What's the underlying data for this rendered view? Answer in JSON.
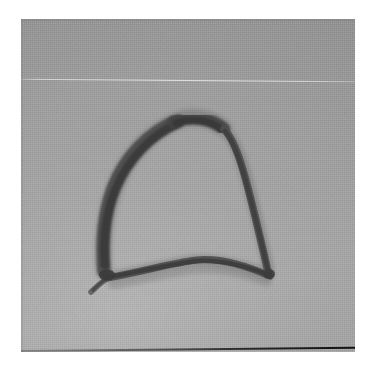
{
  "page": {
    "width": 378,
    "height": 375,
    "border_color": "#ffffff",
    "kind": "scanned-photograph"
  },
  "photo": {
    "x": 21,
    "y": 19,
    "width": 334,
    "height": 333,
    "background_color": "#9d9d9d",
    "background_highlight": "#a6a6a6",
    "background_shadow": "#939393",
    "caption": "",
    "artifacts": {
      "scratch_line": "faint light horizontal scratch across upper third",
      "bottom_edge": "dark film edge along bottom border"
    }
  },
  "artwork": {
    "title": "",
    "subject": "hand-drawn arch outline",
    "medium": "dark brush / ink stroke",
    "stroke_color": "#3c3c3c",
    "stroke_color_light": "#5c5c5c",
    "strokes": [
      {
        "name": "arch-left-limb",
        "description": "thick stroke rising from lower-left up to the apex",
        "path": "M 83 252 C 81 226, 83 196, 94 168 C 106 137, 130 112, 158 101"
      },
      {
        "name": "arch-apex",
        "description": "rounded crown of the arch",
        "path": "M 158 101 C 172 97, 190 99, 202 109"
      },
      {
        "name": "arch-right-limb",
        "description": "tapering stroke descending from apex to lower-right",
        "path": "M 202 109 C 215 122, 222 144, 230 176 C 238 208, 244 234, 248 254"
      },
      {
        "name": "base-curve",
        "description": "shallow arc joining the two limbs along the bottom",
        "path": "M 86 258 C 122 252, 152 243, 176 241 C 202 240, 228 248, 248 256"
      },
      {
        "name": "base-tail",
        "description": "short tail trailing down-left past the left junction",
        "path": "M 86 258 C 80 262, 75 266, 70 272"
      }
    ],
    "junctions": [
      {
        "name": "left-junction-blob",
        "cx": 86,
        "cy": 256,
        "r": 6
      },
      {
        "name": "right-junction-blob",
        "cx": 248,
        "cy": 255,
        "r": 5
      }
    ]
  }
}
